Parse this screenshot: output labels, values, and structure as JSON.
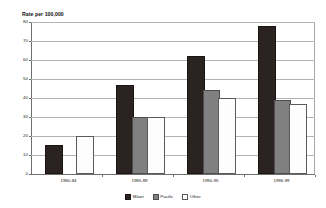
{
  "chart_data": {
    "type": "bar",
    "title": "",
    "ylabel": "Rate per 100,000",
    "xlabel": "",
    "ylim": [
      0,
      80
    ],
    "ytick_step": 10,
    "yticks": [
      0,
      10,
      20,
      30,
      40,
      50,
      60,
      70,
      80
    ],
    "grid": true,
    "legend_position": "bottom",
    "categories": [
      "1980-84",
      "1985-89",
      "1990-95",
      "1996-99"
    ],
    "series": [
      {
        "name": "Māori",
        "color": "#2b2322",
        "values": [
          14,
          46,
          61,
          77
        ]
      },
      {
        "name": "Pacific",
        "color": "#808080",
        "values": [
          0,
          29,
          43,
          38
        ]
      },
      {
        "name": "Other",
        "color": "#ffffff",
        "values": [
          19,
          29,
          39,
          36
        ]
      }
    ]
  },
  "legend": {
    "items": [
      {
        "label": "Māori"
      },
      {
        "label": "Pacific"
      },
      {
        "label": "Other"
      }
    ]
  },
  "colors": {
    "maori": "#2b2322",
    "pacific": "#808080",
    "other": "#ffffff",
    "gridline": "#b4b4b4",
    "axis": "#6e6e6e",
    "background": "#ffffff"
  }
}
